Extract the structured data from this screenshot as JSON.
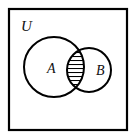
{
  "figure": {
    "type": "venn-diagram",
    "background_color": "#ffffff",
    "stroke_color": "#000000",
    "label_color": "#111111"
  },
  "universe": {
    "label": "U",
    "label_x": 21,
    "label_y": 31,
    "rect": {
      "x": 9,
      "y": 9,
      "width": 118,
      "height": 121
    },
    "stroke_width": 2.2
  },
  "sets": [
    {
      "name": "set-a",
      "label": "A",
      "cx": 54,
      "cy": 67,
      "r": 30,
      "label_x": 47,
      "label_y": 73,
      "stroke_width": 2.0
    },
    {
      "name": "set-b",
      "label": "B",
      "cx": 89,
      "cy": 70,
      "r": 22,
      "label_x": 96,
      "label_y": 75,
      "stroke_width": 2.0
    }
  ],
  "intersection": {
    "name": "a-intersect-b",
    "fill_pattern": "horizontal-hatch",
    "hatch_line_count": 10,
    "hatch_spacing": 4,
    "hatch_stroke_width": 1.1,
    "stroke_color": "#000000"
  }
}
